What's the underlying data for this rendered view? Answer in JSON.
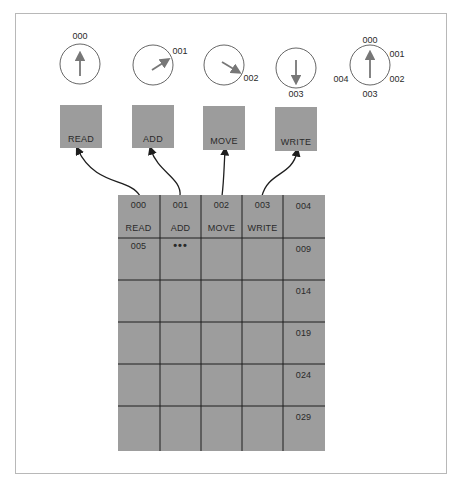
{
  "dials": [
    {
      "id": "dial-1",
      "cx": 80,
      "cy": 64,
      "pointer_angle_deg": 0,
      "labels": [
        {
          "text": "000",
          "x": 80,
          "y": 36
        }
      ]
    },
    {
      "id": "dial-2",
      "cx": 153,
      "cy": 65,
      "pointer_angle_deg": 60,
      "labels": [
        {
          "text": "001",
          "x": 180,
          "y": 51
        }
      ]
    },
    {
      "id": "dial-3",
      "cx": 224,
      "cy": 65,
      "pointer_angle_deg": 120,
      "labels": [
        {
          "text": "002",
          "x": 251,
          "y": 78
        }
      ]
    },
    {
      "id": "dial-4",
      "cx": 296,
      "cy": 68,
      "pointer_angle_deg": 180,
      "labels": [
        {
          "text": "003",
          "x": 296,
          "y": 94
        }
      ]
    },
    {
      "id": "dial-legend",
      "cx": 370,
      "cy": 65,
      "pointer_angle_deg": 0,
      "labels": [
        {
          "text": "000",
          "x": 370,
          "y": 40
        },
        {
          "text": "001",
          "x": 397,
          "y": 54
        },
        {
          "text": "002",
          "x": 397,
          "y": 79
        },
        {
          "text": "003",
          "x": 370,
          "y": 94
        },
        {
          "text": "004",
          "x": 341,
          "y": 79
        }
      ]
    }
  ],
  "operations": [
    {
      "label": "READ",
      "x": 60,
      "y": 105
    },
    {
      "label": "ADD",
      "x": 132,
      "y": 105
    },
    {
      "label": "MOVE",
      "x": 203,
      "y": 106
    },
    {
      "label": "WRITE",
      "x": 275,
      "y": 107
    }
  ],
  "memory_grid": {
    "columns": 5,
    "rows": 6,
    "row0_addresses": [
      "000",
      "001",
      "002",
      "003",
      "004"
    ],
    "row0_contents": [
      "READ",
      "ADD",
      "MOVE",
      "WRITE",
      ""
    ],
    "row1_first_address": "005",
    "row1_ellipsis": "•••",
    "right_column_addresses": [
      "009",
      "014",
      "019",
      "024",
      "029"
    ]
  },
  "colors": {
    "box_fill": "#9c9c9c",
    "grid_fill": "#9d9d9d",
    "line": "#1e1e1e",
    "dial_stroke": "#555555",
    "pointer": "#777777"
  }
}
